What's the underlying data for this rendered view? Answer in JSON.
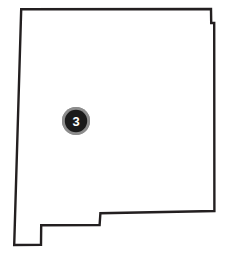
{
  "figure": {
    "name": "state-outline-map-with-marker",
    "background_color": "#ffffff",
    "width": 231,
    "height": 258
  },
  "map": {
    "shape_name": "new-mexico-state-outline",
    "outline_color": "#231f20",
    "fill_color": "#ffffff",
    "stroke_width": 2.4,
    "outline_path": "M 21.2,9.2 L 211.0,9.0 L 211.2,23.0 L 214.2,23.0 L 214.4,211.0 L 100.4,213.2 L 99.6,225.0 L 41.2,225.2 L 41.0,244.8 L 14.2,245.0 Z",
    "vertices": [
      [
        21.2,
        9.2
      ],
      [
        211.0,
        9.0
      ],
      [
        211.2,
        23.0
      ],
      [
        214.2,
        23.0
      ],
      [
        214.4,
        211.0
      ],
      [
        100.4,
        213.2
      ],
      [
        99.6,
        225.0
      ],
      [
        41.2,
        225.2
      ],
      [
        41.0,
        244.8
      ],
      [
        14.2,
        245.0
      ]
    ]
  },
  "marker": {
    "label": "3",
    "center_x": 76,
    "center_y": 121,
    "ring_radius": 14,
    "disc_radius": 11.2,
    "ring_color": "#8d8d8d",
    "disc_color": "#1a1a1a",
    "label_color": "#ffffff"
  }
}
